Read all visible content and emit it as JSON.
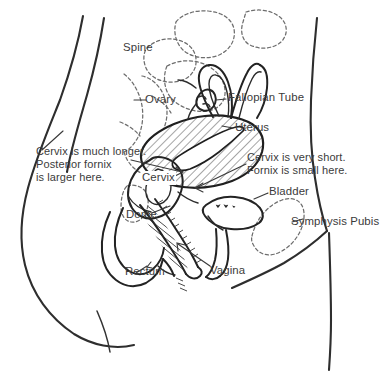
{
  "figure": {
    "labels": {
      "spine": "Spine",
      "ovary": "Ovary",
      "fallopian_tube": "Fallopian Tube",
      "uterus": "Uterus",
      "cervix": "Cervix",
      "bladder": "Bladder",
      "symphysis_pubis": "Symphysis Pubis",
      "dome": "Dome",
      "rectum": "Rectum",
      "vagina": "Vagina"
    },
    "annotations": {
      "left_note_line1": "Cervix is much longer.",
      "left_note_line2": "Posterior fornix",
      "left_note_line3": "is larger here.",
      "right_note_line1": "Cervix is very short.",
      "right_note_line2": "Fornix is small here."
    },
    "colors": {
      "background": "#ffffff",
      "body_outline": "#2e2e2e",
      "organ_outline": "#232323",
      "bone_dashed": "#6d6d6d",
      "text": "#3b3b3b",
      "leader_line": "#3a3a3a",
      "uterus_hatch": "#2a2a2a"
    }
  }
}
